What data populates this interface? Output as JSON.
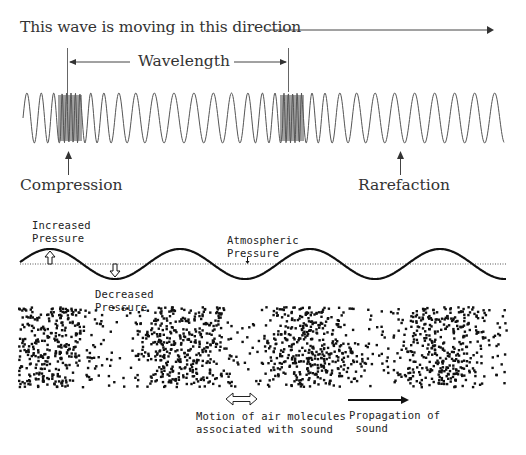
{
  "top_diagram": {
    "title": "This wave is moving in this direction",
    "wavelength_label": "Wavelength",
    "compression_label": "Compression",
    "rarefaction_label": "Rarefaction",
    "compression_positions_px": [
      70,
      292
    ],
    "rarefaction_marker_px": 400
  },
  "pressure_diagram": {
    "increased_pressure": "Increased\nPressure",
    "decreased_pressure": "Decreased\nPressure",
    "atmospheric_pressure": "Atmospheric\nPressure",
    "baseline_y": 264,
    "amplitude_px": 15,
    "period_px": 130,
    "peak_x_positions": [
      50,
      180,
      310,
      440
    ]
  },
  "molecules_diagram": {
    "dense_region_centers_px": [
      50,
      180,
      310,
      440
    ],
    "motion_label": "Motion of air molecules\nassociated with sound",
    "propagation_label": "Propagation of\n sound"
  },
  "colors": {
    "ink": "#333333",
    "compression_fill": "#555555",
    "dots": "#111111"
  }
}
